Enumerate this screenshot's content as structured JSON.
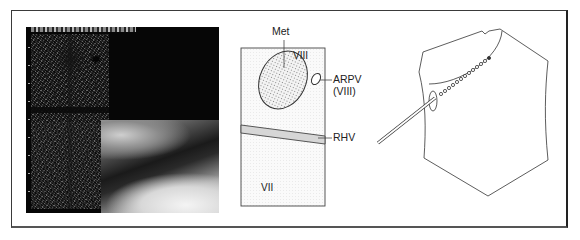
{
  "figure": {
    "panels": [
      {
        "id": "ultrasound-endoscopy",
        "type": "photo-composite"
      },
      {
        "id": "schematic",
        "type": "diagram"
      },
      {
        "id": "approach-illustration",
        "type": "diagram"
      }
    ]
  },
  "schematic": {
    "labels": {
      "met": "Met",
      "segment_viii": "VIII",
      "arpv_line1": "ARPV",
      "arpv_line2": "(VIII)",
      "rhv": "RHV",
      "segment_vii": "VII"
    }
  },
  "colors": {
    "stroke": "#333333",
    "frame": "#3a3a3a",
    "dot_fill": "#e8e8e8",
    "vessel_fill": "#d6d6d6"
  }
}
